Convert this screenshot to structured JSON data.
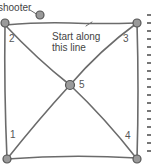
{
  "diagram": {
    "labels": {
      "shooter": "shooter",
      "start_line_1": "Start along",
      "start_line_2": "this line"
    },
    "marbles": [
      {
        "id": "1",
        "label": "1",
        "x": 7,
        "y": 159
      },
      {
        "id": "2",
        "label": "2",
        "x": 5,
        "y": 22
      },
      {
        "id": "3",
        "label": "3",
        "x": 137,
        "y": 24
      },
      {
        "id": "4",
        "label": "4",
        "x": 137,
        "y": 159
      },
      {
        "id": "5",
        "label": "5",
        "x": 70,
        "y": 85
      }
    ],
    "shooter_marble": {
      "x": 40,
      "y": 16
    },
    "colors": {
      "line": "#6b6b6b",
      "marble_fill": "#9a9a9a",
      "marble_stroke": "#555555",
      "text": "#444444"
    }
  }
}
